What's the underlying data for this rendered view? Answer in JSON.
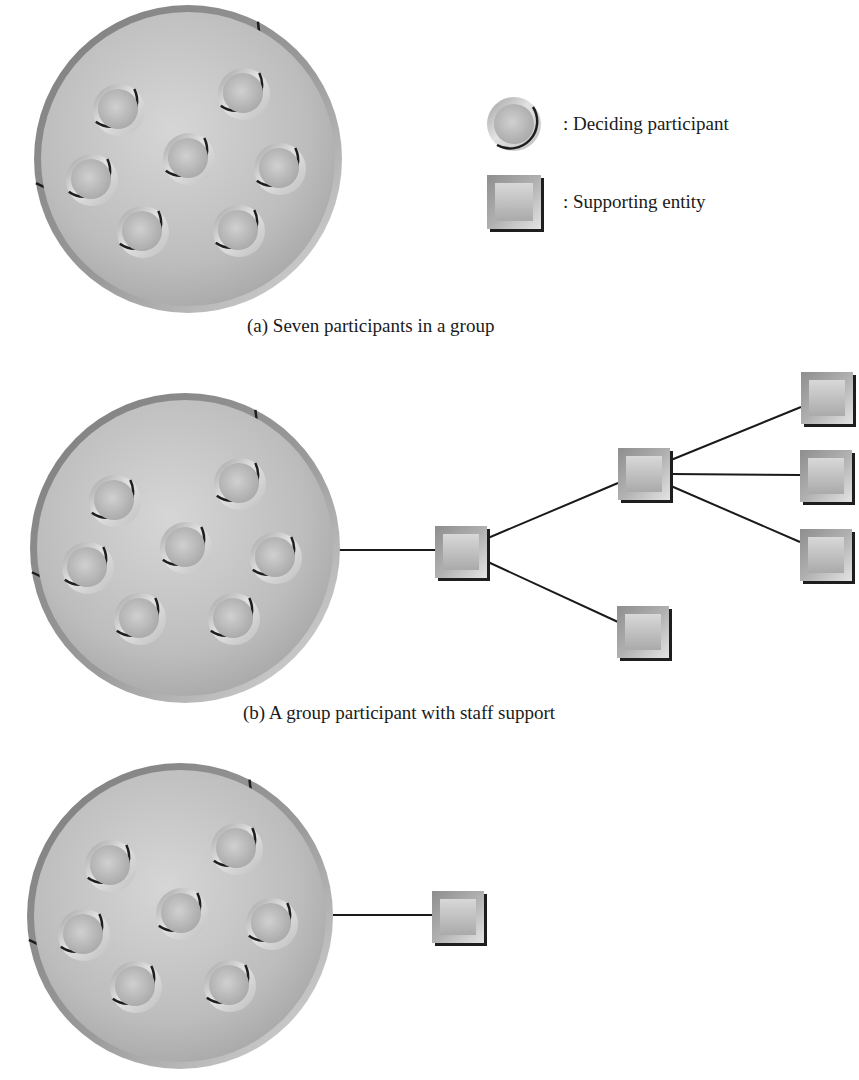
{
  "legend": {
    "items": [
      {
        "shape": "circle",
        "icon": "deciding-participant-icon",
        "label": ": Deciding participant"
      },
      {
        "shape": "square",
        "icon": "supporting-entity-icon",
        "label": ": Supporting entity"
      }
    ]
  },
  "panels": [
    {
      "id": "a",
      "caption": "(a) Seven participants in a group",
      "group": {
        "cx": 188,
        "cy": 159,
        "r": 154
      },
      "participants": [
        {
          "cx": 119,
          "cy": 110
        },
        {
          "cx": 244,
          "cy": 94
        },
        {
          "cx": 189,
          "cy": 159
        },
        {
          "cx": 92,
          "cy": 180
        },
        {
          "cx": 280,
          "cy": 169
        },
        {
          "cx": 143,
          "cy": 232
        },
        {
          "cx": 239,
          "cy": 231
        }
      ],
      "supporting_entities": [],
      "links": []
    },
    {
      "id": "b",
      "caption": "(b) A group participant with staff support",
      "group": {
        "cx": 185,
        "cy": 548,
        "r": 155
      },
      "participants": [
        {
          "cx": 115,
          "cy": 501
        },
        {
          "cx": 240,
          "cy": 484
        },
        {
          "cx": 186,
          "cy": 548
        },
        {
          "cx": 88,
          "cy": 568
        },
        {
          "cx": 276,
          "cy": 558
        },
        {
          "cx": 140,
          "cy": 619
        },
        {
          "cx": 234,
          "cy": 619
        }
      ],
      "supporting_entities": [
        {
          "id": "s1",
          "x": 435,
          "y": 526,
          "size": 52
        },
        {
          "id": "s2",
          "x": 618,
          "y": 448,
          "size": 52
        },
        {
          "id": "s3",
          "x": 617,
          "y": 606,
          "size": 52
        },
        {
          "id": "s4",
          "x": 801,
          "y": 372,
          "size": 52
        },
        {
          "id": "s5",
          "x": 800,
          "y": 450,
          "size": 52
        },
        {
          "id": "s6",
          "x": 800,
          "y": 529,
          "size": 52
        }
      ],
      "links": [
        {
          "x1": 307,
          "y1": 550,
          "x2": 435,
          "y2": 550
        },
        {
          "x1": 488,
          "y1": 538,
          "x2": 618,
          "y2": 483
        },
        {
          "x1": 488,
          "y1": 562,
          "x2": 618,
          "y2": 622
        },
        {
          "x1": 671,
          "y1": 460,
          "x2": 801,
          "y2": 407
        },
        {
          "x1": 671,
          "y1": 474,
          "x2": 800,
          "y2": 475
        },
        {
          "x1": 671,
          "y1": 486,
          "x2": 800,
          "y2": 542
        }
      ]
    },
    {
      "id": "c",
      "caption": "",
      "group": {
        "cx": 180,
        "cy": 916,
        "r": 153
      },
      "participants": [
        {
          "cx": 111,
          "cy": 866
        },
        {
          "cx": 237,
          "cy": 849
        },
        {
          "cx": 182,
          "cy": 914
        },
        {
          "cx": 84,
          "cy": 935
        },
        {
          "cx": 272,
          "cy": 924
        },
        {
          "cx": 136,
          "cy": 987
        },
        {
          "cx": 230,
          "cy": 986
        }
      ],
      "supporting_entities": [
        {
          "id": "s1",
          "x": 432,
          "y": 891,
          "size": 52
        }
      ],
      "links": [
        {
          "x1": 333,
          "y1": 915,
          "x2": 432,
          "y2": 915
        }
      ]
    }
  ],
  "colors": {
    "group_fill_light": "#d2d2d2",
    "group_fill_dark": "#a9a9a9",
    "group_rim": "#8c8c8c",
    "participant_fill": "#c4c4c4",
    "square_outer": "#9c9c9c",
    "square_inner": "#cfcfcf",
    "shadow": "#1e1e1e",
    "line": "#1a1a1a"
  }
}
